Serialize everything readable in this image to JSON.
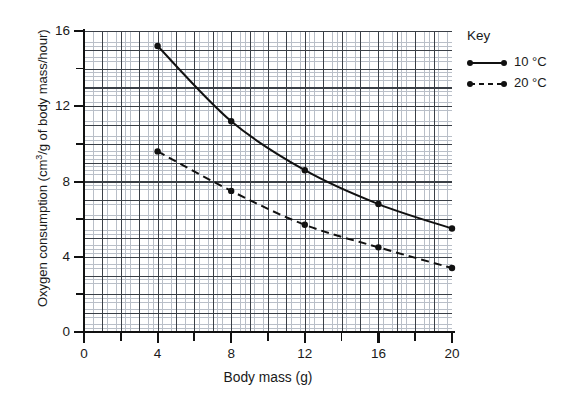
{
  "chart_data": {
    "type": "line",
    "title": "",
    "xlabel": "Body mass (g)",
    "ylabel": "Oxygen consumption (cm3/g of body mass/hour)",
    "ylabel_parts": {
      "lead": "Oxygen consumption (cm",
      "sup": "3",
      "tail": "/g of body mass/hour)"
    },
    "xlim": [
      0,
      20
    ],
    "ylim": [
      0,
      16
    ],
    "x_ticks": [
      "0",
      "4",
      "8",
      "12",
      "16",
      "20"
    ],
    "x_tick_values": [
      0,
      4,
      8,
      12,
      16,
      20
    ],
    "x_minor_tick_values": [
      2,
      6,
      10,
      14,
      18
    ],
    "y_ticks": [
      "0",
      "4",
      "8",
      "12",
      "16"
    ],
    "y_tick_values": [
      0,
      4,
      8,
      12,
      16
    ],
    "y_minor_tick_values": [
      2,
      6,
      10,
      14
    ],
    "grid": true,
    "legend_position": "right",
    "legend_title": "Key",
    "series": [
      {
        "name": "10 °C",
        "style": "solid",
        "marker": "filled-circle",
        "x": [
          4,
          8,
          12,
          16,
          20
        ],
        "values": [
          15.2,
          11.2,
          8.6,
          6.8,
          5.5
        ]
      },
      {
        "name": "20 °C",
        "style": "dashed",
        "marker": "filled-circle",
        "x": [
          4,
          8,
          12,
          16,
          20
        ],
        "values": [
          9.6,
          7.5,
          5.7,
          4.5,
          3.4
        ]
      }
    ]
  },
  "key": {
    "title": "Key",
    "entries": [
      {
        "label": "10 °C",
        "style": "solid"
      },
      {
        "label": "20 °C",
        "style": "dashed"
      }
    ]
  }
}
